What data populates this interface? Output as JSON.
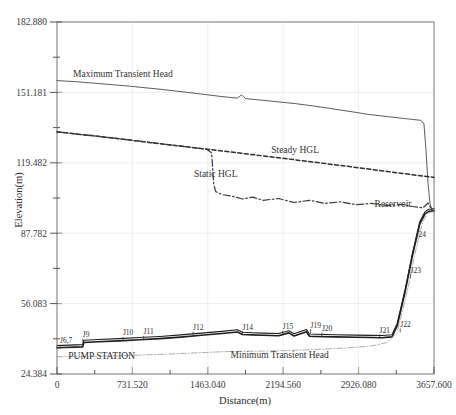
{
  "chart_data": {
    "type": "line",
    "title": "",
    "xlabel": "Distance(m)",
    "ylabel": "Elevation(m)",
    "xlim": [
      0,
      3657.6
    ],
    "ylim": [
      24.384,
      182.88
    ],
    "grid": false,
    "legend_position": "inline-annotations",
    "xticks": [
      0,
      731.52,
      1463.04,
      2194.56,
      2926.08,
      3657.6
    ],
    "xtick_labels": [
      "0",
      "731.520",
      "1463.040",
      "2194.560",
      "2926.080",
      "3657.600"
    ],
    "yticks": [
      24.384,
      40.234,
      56.083,
      71.932,
      87.782,
      103.632,
      119.482,
      135.331,
      151.181,
      167.03,
      182.88
    ],
    "ytick_labels": [
      "24.384",
      "",
      "56.083",
      "",
      "87.782",
      "",
      "119.482",
      "",
      "151.181",
      "",
      "182.880"
    ],
    "ymajor_labels": [
      "24.384",
      "56.083",
      "87.782",
      "119.482",
      "151.181",
      "182.880"
    ],
    "series": [
      {
        "name": "Maximum Transient Head",
        "style": "solid",
        "label_x": 640,
        "label_y": 158.0,
        "points": [
          [
            0,
            156.5
          ],
          [
            180,
            156.0
          ],
          [
            400,
            155.2
          ],
          [
            700,
            154.0
          ],
          [
            1000,
            152.6
          ],
          [
            1300,
            151.0
          ],
          [
            1600,
            149.3
          ],
          [
            1750,
            148.6
          ],
          [
            1790,
            150.1
          ],
          [
            1830,
            148.4
          ],
          [
            2000,
            147.6
          ],
          [
            2300,
            146.2
          ],
          [
            2500,
            145.0
          ],
          [
            2700,
            143.6
          ],
          [
            2900,
            142.2
          ],
          [
            3000,
            141.4
          ],
          [
            3200,
            140.3
          ],
          [
            3350,
            139.5
          ],
          [
            3450,
            139.0
          ],
          [
            3530,
            138.6
          ],
          [
            3560,
            137.0
          ],
          [
            3580,
            125.0
          ],
          [
            3600,
            110.0
          ],
          [
            3620,
            101.0
          ],
          [
            3640,
            98.2
          ],
          [
            3657.6,
            97.6
          ]
        ]
      },
      {
        "name": "Steady HGL",
        "style": "dashed",
        "label_x": 2310,
        "label_y": 124.0,
        "points": [
          [
            0,
            133.4
          ],
          [
            400,
            131.4
          ],
          [
            800,
            129.2
          ],
          [
            1200,
            127.0
          ],
          [
            1600,
            124.8
          ],
          [
            2000,
            122.6
          ],
          [
            2400,
            120.3
          ],
          [
            2800,
            118.0
          ],
          [
            3200,
            115.6
          ],
          [
            3450,
            114.1
          ],
          [
            3657.6,
            112.9
          ]
        ]
      },
      {
        "name": "Static HGL",
        "style": "dash-dot",
        "label_x": 1540,
        "label_y": 113.0,
        "points": [
          [
            0,
            133.4
          ],
          [
            400,
            131.4
          ],
          [
            800,
            129.2
          ],
          [
            1200,
            127.0
          ],
          [
            1450,
            125.6
          ],
          [
            1500,
            124.0
          ],
          [
            1520,
            110.0
          ],
          [
            1540,
            106.5
          ],
          [
            1600,
            105.2
          ],
          [
            1700,
            104.4
          ],
          [
            1800,
            103.2
          ],
          [
            1900,
            104.0
          ],
          [
            2000,
            102.6
          ],
          [
            2150,
            103.4
          ],
          [
            2300,
            101.6
          ],
          [
            2450,
            102.6
          ],
          [
            2600,
            101.2
          ],
          [
            2750,
            101.9
          ],
          [
            2900,
            100.6
          ],
          [
            3050,
            101.2
          ],
          [
            3200,
            100.2
          ],
          [
            3350,
            100.8
          ],
          [
            3450,
            99.8
          ],
          [
            3550,
            99.2
          ],
          [
            3600,
            101.4
          ],
          [
            3640,
            97.8
          ],
          [
            3657.6,
            97.6
          ]
        ]
      },
      {
        "name": "Reservoir",
        "style": "annotation",
        "label_x": 3260,
        "label_y": 99.5
      },
      {
        "name": "Pipeline Profile",
        "style": "solid-thick",
        "points": [
          [
            0,
            36.2
          ],
          [
            60,
            36.3
          ],
          [
            180,
            36.5
          ],
          [
            250,
            36.6
          ],
          [
            260,
            38.6
          ],
          [
            400,
            38.9
          ],
          [
            600,
            39.3
          ],
          [
            800,
            39.8
          ],
          [
            1000,
            40.3
          ],
          [
            1200,
            41.0
          ],
          [
            1400,
            41.8
          ],
          [
            1600,
            42.6
          ],
          [
            1750,
            43.3
          ],
          [
            1800,
            42.2
          ],
          [
            1900,
            42.0
          ],
          [
            2000,
            41.8
          ],
          [
            2150,
            41.6
          ],
          [
            2250,
            42.9
          ],
          [
            2300,
            41.5
          ],
          [
            2420,
            43.4
          ],
          [
            2450,
            41.4
          ],
          [
            2500,
            41.3
          ],
          [
            2700,
            41.1
          ],
          [
            2900,
            40.9
          ],
          [
            3050,
            40.8
          ],
          [
            3150,
            40.7
          ],
          [
            3250,
            41.1
          ],
          [
            3300,
            46.0
          ],
          [
            3380,
            62.0
          ],
          [
            3450,
            78.0
          ],
          [
            3520,
            92.0
          ],
          [
            3570,
            96.5
          ],
          [
            3610,
            97.6
          ],
          [
            3657.6,
            97.8
          ]
        ]
      },
      {
        "name": "Minimum Transient Head",
        "style": "dash-dot-thin",
        "label_x": 2160,
        "label_y": 31.6,
        "points": [
          [
            0,
            32.2
          ],
          [
            200,
            32.2
          ],
          [
            400,
            32.4
          ],
          [
            600,
            32.6
          ],
          [
            800,
            32.9
          ],
          [
            1000,
            33.2
          ],
          [
            1200,
            33.6
          ],
          [
            1400,
            34.0
          ],
          [
            1600,
            34.4
          ],
          [
            1800,
            34.6
          ],
          [
            2000,
            34.7
          ],
          [
            2200,
            34.9
          ],
          [
            2400,
            35.2
          ],
          [
            2600,
            35.6
          ],
          [
            2800,
            36.1
          ],
          [
            3000,
            36.8
          ],
          [
            3100,
            37.4
          ],
          [
            3200,
            38.6
          ],
          [
            3300,
            43.0
          ],
          [
            3400,
            62.0
          ],
          [
            3480,
            80.0
          ],
          [
            3550,
            93.0
          ],
          [
            3600,
            97.0
          ],
          [
            3657.6,
            97.6
          ]
        ]
      }
    ],
    "node_labels": [
      {
        "text": "J6,7",
        "x": 30,
        "y": 38.3
      },
      {
        "text": "J9",
        "x": 250,
        "y": 41.0
      },
      {
        "text": "J10",
        "x": 640,
        "y": 41.8
      },
      {
        "text": "J11",
        "x": 840,
        "y": 42.2
      },
      {
        "text": "J12",
        "x": 1320,
        "y": 44.2
      },
      {
        "text": "J14",
        "x": 1800,
        "y": 44.4
      },
      {
        "text": "J15",
        "x": 2190,
        "y": 44.6
      },
      {
        "text": "J19",
        "x": 2460,
        "y": 45.2
      },
      {
        "text": "J20",
        "x": 2570,
        "y": 43.8
      },
      {
        "text": "J21",
        "x": 3130,
        "y": 43.0
      },
      {
        "text": "J22",
        "x": 3330,
        "y": 45.6
      },
      {
        "text": "J23",
        "x": 3430,
        "y": 70.0
      },
      {
        "text": "J24",
        "x": 3480,
        "y": 86.0
      }
    ],
    "annotations": [
      {
        "text": "PUMP STATION",
        "x": 110,
        "y": 31.3
      }
    ]
  },
  "labels": {
    "y_axis_title": "Elevation(m)",
    "x_axis_title": "Distance(m)"
  }
}
